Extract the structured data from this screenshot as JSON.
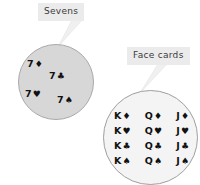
{
  "canvas": {
    "width": 200,
    "height": 185,
    "background_color": "#ffffff"
  },
  "callouts": [
    {
      "id": "sevens",
      "label": "Sevens",
      "box_color": "#ebebeb",
      "text_color": "#3a3a3a"
    },
    {
      "id": "face_cards",
      "label": "Face cards",
      "box_color": "#ebebeb",
      "text_color": "#3a3a3a"
    }
  ],
  "sets": {
    "sevens": {
      "label": "Sevens",
      "fill_color": "#d7d7d7",
      "border_color": "#a9a9a9",
      "members": [
        {
          "rank": "7",
          "suit": "♦",
          "suit_name": "diamonds",
          "card": "7♦"
        },
        {
          "rank": "7",
          "suit": "♣",
          "suit_name": "clubs",
          "card": "7♣"
        },
        {
          "rank": "7",
          "suit": "♥",
          "suit_name": "hearts",
          "card": "7♥"
        },
        {
          "rank": "7",
          "suit": "♠",
          "suit_name": "spades",
          "card": "7♠"
        }
      ]
    },
    "face_cards": {
      "label": "Face cards",
      "fill_color": "#f4f4f4",
      "border_color": "#9f9f9f",
      "rows": [
        {
          "suit": "♦",
          "suit_name": "diamonds",
          "cards": [
            {
              "rank": "K",
              "suit": "♦"
            },
            {
              "rank": "Q",
              "suit": "♦"
            },
            {
              "rank": "J",
              "suit": "♦"
            }
          ]
        },
        {
          "suit": "♥",
          "suit_name": "hearts",
          "cards": [
            {
              "rank": "K",
              "suit": "♥"
            },
            {
              "rank": "Q",
              "suit": "♥"
            },
            {
              "rank": "J",
              "suit": "♥"
            }
          ]
        },
        {
          "suit": "♣",
          "suit_name": "clubs",
          "cards": [
            {
              "rank": "K",
              "suit": "♣"
            },
            {
              "rank": "Q",
              "suit": "♣"
            },
            {
              "rank": "J",
              "suit": "♣"
            }
          ]
        },
        {
          "suit": "♠",
          "suit_name": "spades",
          "cards": [
            {
              "rank": "K",
              "suit": "♠"
            },
            {
              "rank": "Q",
              "suit": "♠"
            },
            {
              "rank": "J",
              "suit": "♠"
            }
          ]
        }
      ]
    }
  }
}
